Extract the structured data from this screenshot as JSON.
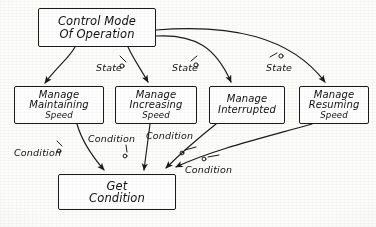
{
  "diagram": {
    "type": "hand-drawn-block-diagram",
    "ink_color": "#1a1a1a",
    "paper_color": "#fdfdfb"
  },
  "nodes": [
    {
      "id": "control-mode",
      "lines": [
        "Control Mode",
        "Of Operation"
      ],
      "x": 38,
      "y": 8,
      "w": 118,
      "h": 39,
      "font": 11.5
    },
    {
      "id": "manage-maintaining",
      "lines": [
        "Manage",
        "Maintaining",
        "Speed"
      ],
      "x": 14,
      "y": 86,
      "w": 90,
      "h": 38,
      "font": 10
    },
    {
      "id": "manage-increasing",
      "lines": [
        "Manage",
        "Increasing",
        "Speed"
      ],
      "x": 115,
      "y": 86,
      "w": 82,
      "h": 38,
      "font": 10
    },
    {
      "id": "manage-interrupted",
      "lines": [
        "Manage",
        "Interrupted"
      ],
      "x": 209,
      "y": 86,
      "w": 76,
      "h": 38,
      "font": 10
    },
    {
      "id": "manage-resuming",
      "lines": [
        "Manage",
        "Resuming",
        "Speed"
      ],
      "x": 299,
      "y": 86,
      "w": 70,
      "h": 38,
      "font": 10
    },
    {
      "id": "get-condition",
      "lines": [
        "Get",
        "Condition"
      ],
      "x": 58,
      "y": 174,
      "w": 118,
      "h": 36,
      "font": 11.5
    }
  ],
  "edge_labels": [
    {
      "id": "state-1",
      "text": "State",
      "x": 96,
      "y": 63,
      "font": 9.5
    },
    {
      "id": "state-2",
      "text": "State",
      "x": 172,
      "y": 63,
      "font": 9.5
    },
    {
      "id": "state-3",
      "text": "State",
      "x": 266,
      "y": 63,
      "font": 9.5
    },
    {
      "id": "condition-1",
      "text": "Condition",
      "x": 14,
      "y": 148,
      "font": 9.5
    },
    {
      "id": "condition-2",
      "text": "Condition",
      "x": 88,
      "y": 134,
      "font": 9.5
    },
    {
      "id": "condition-3",
      "text": "Condition",
      "x": 146,
      "y": 131,
      "font": 9.5
    },
    {
      "id": "condition-4",
      "text": "Condition",
      "x": 185,
      "y": 165,
      "font": 9.5
    }
  ],
  "edges": [
    {
      "id": "control-to-maintaining",
      "from": "control-mode",
      "to": "manage-maintaining",
      "label": "State",
      "style": "curved-arrow"
    },
    {
      "id": "control-to-increasing",
      "from": "control-mode",
      "to": "manage-increasing",
      "label": "State",
      "style": "curved-arrow"
    },
    {
      "id": "control-to-interrupted",
      "from": "control-mode",
      "to": "manage-interrupted",
      "label": "State",
      "style": "curved-arrow"
    },
    {
      "id": "control-to-resuming",
      "from": "control-mode",
      "to": "manage-resuming",
      "label": "State",
      "style": "curved-arrow"
    },
    {
      "id": "maintaining-to-get",
      "from": "manage-maintaining",
      "to": "get-condition",
      "label": "Condition",
      "style": "curved-arrow"
    },
    {
      "id": "increasing-to-get",
      "from": "manage-increasing",
      "to": "get-condition",
      "label": "Condition",
      "style": "curved-arrow"
    },
    {
      "id": "interrupted-to-get",
      "from": "manage-interrupted",
      "to": "get-condition",
      "label": "Condition",
      "style": "curved-arrow"
    },
    {
      "id": "resuming-to-get",
      "from": "manage-resuming",
      "to": "get-condition",
      "label": "Condition",
      "style": "curved-arrow"
    }
  ]
}
